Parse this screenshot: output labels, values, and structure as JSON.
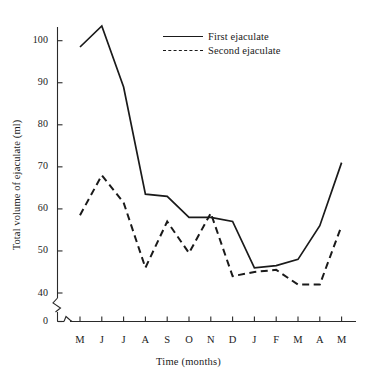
{
  "chart_data": {
    "type": "line",
    "title": "",
    "xlabel": "Time (months)",
    "ylabel": "Total volume of ejaculate (ml)",
    "categories": [
      "M",
      "J",
      "J",
      "A",
      "S",
      "O",
      "N",
      "D",
      "J",
      "F",
      "M",
      "A",
      "M"
    ],
    "xtick_labels": [
      "M",
      "J",
      "J",
      "A",
      "S",
      "O",
      "N",
      "D",
      "J",
      "F",
      "M",
      "A",
      "M"
    ],
    "ytick_labels": [
      "0",
      "40",
      "50",
      "60",
      "70",
      "80",
      "90",
      "100"
    ],
    "ytick_values": [
      0,
      40,
      50,
      60,
      70,
      80,
      90,
      100
    ],
    "ylim": [
      40,
      104
    ],
    "axis_break": true,
    "grid": false,
    "legend_position": "top-center",
    "series": [
      {
        "name": "First ejaculate",
        "style": "solid",
        "color": "#1a1a1a",
        "values": [
          98.5,
          103.5,
          89.0,
          63.5,
          63.0,
          58.0,
          58.0,
          57.0,
          46.0,
          46.5,
          48.0,
          56.0,
          71.0
        ]
      },
      {
        "name": "Second ejaculate",
        "style": "dashed",
        "color": "#1a1a1a",
        "values": [
          58.5,
          68.0,
          61.5,
          46.0,
          57.0,
          49.5,
          59.0,
          44.0,
          45.0,
          45.5,
          42.0,
          42.0,
          56.0
        ]
      }
    ]
  },
  "legend": {
    "items": [
      {
        "label": "First ejaculate",
        "style": "solid"
      },
      {
        "label": "Second ejaculate",
        "style": "dashed"
      }
    ]
  },
  "axes": {
    "x_title": "Time (months)",
    "y_title": "Total volume of ejaculate (ml)"
  }
}
